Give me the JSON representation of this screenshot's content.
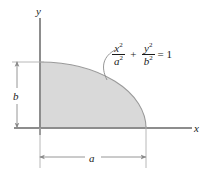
{
  "figure": {
    "background_color": "#ffffff",
    "fill_color": "#d9d9d9",
    "line_color": "#808080",
    "text_color": "#1a1a1a"
  },
  "axes": {
    "x_label": "x",
    "y_label": "y",
    "origin_label": ""
  },
  "dimensions": {
    "horizontal": {
      "label": "a",
      "meaning": "semi-major axis along x"
    },
    "vertical": {
      "label": "b",
      "meaning": "semi-minor axis along y"
    }
  },
  "equation": {
    "numerator_1": "x",
    "numerator_1_exponent": "2",
    "denominator_1": "a",
    "denominator_1_exponent": "2",
    "operator": "+",
    "numerator_2": "y",
    "numerator_2_exponent": "2",
    "denominator_2": "b",
    "denominator_2_exponent": "2",
    "relation": "= 1",
    "plain_text": "x^2/a^2 + y^2/b^2 = 1"
  },
  "annotations": {
    "leader_line": "curve-callout-to-ellipse-arc"
  },
  "icons": {
    "arrow": "arrowhead"
  }
}
